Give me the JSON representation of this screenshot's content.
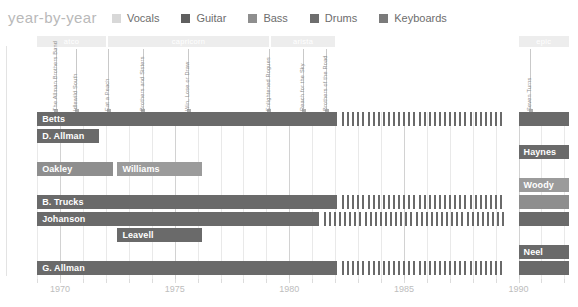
{
  "header": {
    "title": "year-by-year",
    "legend": [
      {
        "label": "Vocals",
        "color": "#d8d8d8"
      },
      {
        "label": "Guitar",
        "color": "#5f5f5f"
      },
      {
        "label": "Bass",
        "color": "#8e8e8e"
      },
      {
        "label": "Drums",
        "color": "#6e6e6e"
      },
      {
        "label": "Keyboards",
        "color": "#7b7b7b"
      }
    ]
  },
  "chart_data": {
    "type": "bar",
    "title": "year-by-year",
    "xlabel": "",
    "ylabel": "",
    "xlim": [
      1968.6,
      1992.2
    ],
    "xticks": [
      1970,
      1975,
      1980,
      1985,
      1990
    ],
    "xticklabels": [
      "1970",
      "1975",
      "1980",
      "1985",
      "1990"
    ],
    "grid": true,
    "legend_position": "top",
    "eras": [
      {
        "name": "atco",
        "start": 1969.0,
        "end": 1972.0
      },
      {
        "name": "capricorn",
        "start": 1972.1,
        "end": 1979.1
      },
      {
        "name": "arista",
        "start": 1979.2,
        "end": 1982.0
      },
      {
        "name": "epic",
        "start": 1990.0,
        "end": 1992.2
      }
    ],
    "albums": [
      {
        "name": "The Allman Brothers Band",
        "year": 1969.8
      },
      {
        "name": "Idlewild South",
        "year": 1970.7
      },
      {
        "name": "Eat a Peach",
        "year": 1972.1
      },
      {
        "name": "Brothers and Sisters",
        "year": 1973.6
      },
      {
        "name": "Win, Lose or Draw",
        "year": 1975.6
      },
      {
        "name": "Enlightened Rogues",
        "year": 1979.1
      },
      {
        "name": "Reach for the Sky",
        "year": 1980.6
      },
      {
        "name": "Brothers of the Road",
        "year": 1981.6
      },
      {
        "name": "Seven Turns",
        "year": 1990.5
      }
    ],
    "categories": [
      "Betts",
      "D. Allman",
      "Haynes",
      "Oakley",
      "Williams",
      "Woody",
      "B. Trucks",
      "Johanson",
      "Leavell",
      "Neel",
      "G. Allman"
    ],
    "rows": [
      {
        "row": 0,
        "segments": [
          {
            "name": "Betts",
            "role": "Guitar",
            "color": "#6a6a6a",
            "start": 1969.0,
            "end": 1982.1,
            "label": "Betts",
            "hatched": false
          },
          {
            "name": "Betts",
            "role": "Guitar",
            "color": "#6a6a6a",
            "start": 1982.3,
            "end": 1989.4,
            "label": "",
            "hatched": true
          },
          {
            "name": "Betts",
            "role": "Guitar",
            "color": "#6a6a6a",
            "start": 1990.0,
            "end": 1992.2,
            "label": "",
            "hatched": false
          }
        ]
      },
      {
        "row": 1,
        "segments": [
          {
            "name": "D. Allman",
            "role": "Guitar",
            "color": "#6a6a6a",
            "start": 1969.0,
            "end": 1971.7,
            "label": "D. Allman",
            "hatched": false
          }
        ]
      },
      {
        "row": 2,
        "segments": [
          {
            "name": "Haynes",
            "role": "Guitar",
            "color": "#6a6a6a",
            "start": 1990.0,
            "end": 1992.2,
            "label": "Haynes",
            "hatched": false
          }
        ]
      },
      {
        "row": 3,
        "segments": [
          {
            "name": "Oakley",
            "role": "Bass",
            "color": "#8e8e8e",
            "start": 1969.0,
            "end": 1972.3,
            "label": "Oakley",
            "hatched": false
          }
        ]
      },
      {
        "row": 3,
        "segments": [
          {
            "name": "Williams",
            "role": "Bass",
            "color": "#9b9b9b",
            "start": 1972.5,
            "end": 1976.2,
            "label": "Williams",
            "hatched": false
          }
        ]
      },
      {
        "row": 4,
        "segments": [
          {
            "name": "Woody",
            "role": "Bass",
            "color": "#9b9b9b",
            "start": 1990.0,
            "end": 1992.2,
            "label": "Woody",
            "hatched": false
          }
        ]
      },
      {
        "row": 5,
        "segments": [
          {
            "name": "B. Trucks",
            "role": "Drums",
            "color": "#6a6a6a",
            "start": 1969.0,
            "end": 1982.1,
            "label": "B. Trucks",
            "hatched": false
          },
          {
            "name": "B. Trucks",
            "role": "Drums",
            "color": "#6a6a6a",
            "start": 1982.3,
            "end": 1989.4,
            "label": "",
            "hatched": true
          },
          {
            "name": "B. Trucks",
            "role": "Drums",
            "color": "#8e8e8e",
            "start": 1990.0,
            "end": 1992.2,
            "label": "",
            "hatched": false
          }
        ]
      },
      {
        "row": 6,
        "segments": [
          {
            "name": "Johanson",
            "role": "Drums",
            "color": "#6a6a6a",
            "start": 1969.0,
            "end": 1981.3,
            "label": "Johanson",
            "hatched": false
          },
          {
            "name": "Johanson",
            "role": "Drums",
            "color": "#6a6a6a",
            "start": 1981.5,
            "end": 1989.4,
            "label": "",
            "hatched": true
          },
          {
            "name": "Johanson",
            "role": "Drums",
            "color": "#6a6a6a",
            "start": 1990.0,
            "end": 1992.2,
            "label": "",
            "hatched": false
          }
        ]
      },
      {
        "row": 7,
        "segments": [
          {
            "name": "Leavell",
            "role": "Keyboards",
            "color": "#6a6a6a",
            "start": 1972.5,
            "end": 1976.2,
            "label": "Leavell",
            "hatched": false
          }
        ]
      },
      {
        "row": 8,
        "segments": [
          {
            "name": "Neel",
            "role": "Keyboards",
            "color": "#6a6a6a",
            "start": 1990.0,
            "end": 1992.2,
            "label": "Neel",
            "hatched": false
          }
        ]
      },
      {
        "row": 9,
        "segments": [
          {
            "name": "G. Allman",
            "role": "Vocals",
            "color": "#6a6a6a",
            "start": 1969.0,
            "end": 1982.1,
            "label": "G. Allman",
            "hatched": false
          },
          {
            "name": "G. Allman",
            "role": "Vocals",
            "color": "#6a6a6a",
            "start": 1982.3,
            "end": 1989.4,
            "label": "",
            "hatched": true
          },
          {
            "name": "G. Allman",
            "role": "Vocals",
            "color": "#6a6a6a",
            "start": 1990.0,
            "end": 1992.2,
            "label": "",
            "hatched": false
          }
        ]
      }
    ]
  }
}
